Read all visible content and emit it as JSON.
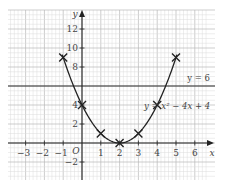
{
  "chart_data": {
    "type": "line",
    "title": "",
    "xlabel": "x",
    "ylabel": "y",
    "origin_label": "O",
    "xlim": [
      -4,
      6.5
    ],
    "ylim": [
      -3.5,
      14
    ],
    "grid": true,
    "x_ticks": [
      -3,
      -2,
      -1,
      1,
      2,
      3,
      4,
      5,
      6
    ],
    "x_tick_labels": [
      "−3",
      "−2",
      "−1",
      "1",
      "2",
      "3",
      "4",
      "5",
      "6"
    ],
    "y_ticks": [
      -2,
      2,
      4,
      8,
      10,
      12
    ],
    "y_tick_labels": [
      "−2",
      "2",
      "4",
      "8",
      "10",
      "12"
    ],
    "series": [
      {
        "name": "y = x² − 4x + 4",
        "kind": "curve",
        "x": [
          -1,
          0,
          1,
          2,
          3,
          4,
          5
        ],
        "y": [
          9,
          4,
          1,
          0,
          1,
          4,
          9
        ],
        "markers": "cross"
      },
      {
        "name": "y = 6",
        "kind": "horizontal-line",
        "y": 6
      }
    ],
    "annotations": [
      {
        "text": "y = 6",
        "x": 5.6,
        "y": 6.5
      },
      {
        "text": "y = x² − 4x + 4",
        "x": 3.3,
        "y": 3.6
      }
    ],
    "colors": {
      "grid_minor": "#dcdcdc",
      "grid_major": "#b8b8b8",
      "axes": "#222222",
      "curve": "#222222",
      "line": "#333333"
    }
  }
}
